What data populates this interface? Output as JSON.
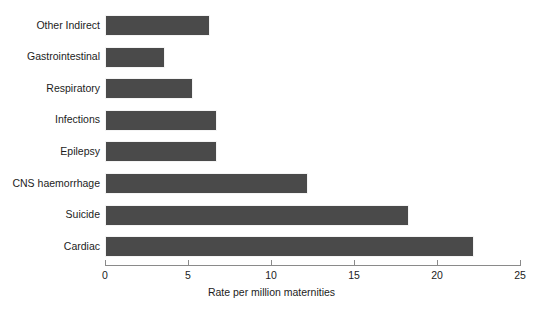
{
  "chart_data": {
    "type": "bar",
    "orientation": "horizontal",
    "title": "",
    "xlabel": "Rate per million maternities",
    "ylabel": "",
    "categories": [
      "Other Indirect",
      "Gastrointestinal",
      "Respiratory",
      "Infections",
      "Epilepsy",
      "CNS haemorrhage",
      "Suicide",
      "Cardiac"
    ],
    "values": [
      6.2,
      3.5,
      5.2,
      6.6,
      6.6,
      12.1,
      18.2,
      22.1
    ],
    "xlim": [
      0,
      25
    ],
    "xticks": [
      0,
      5,
      10,
      15,
      20,
      25
    ],
    "xtick_labels": [
      "0",
      "5",
      "10",
      "15",
      "20",
      "25"
    ],
    "grid": false,
    "legend": null,
    "bar_color": "#4a4a4a",
    "axis_color": "#8a8a8a",
    "background_color": "#ffffff"
  }
}
